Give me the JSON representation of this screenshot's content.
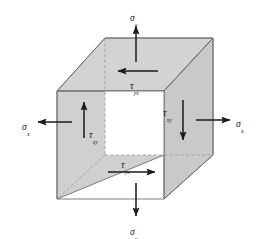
{
  "figure": {
    "type": "stress-element-3d-cube",
    "background_color": "#ffffff",
    "colors": {
      "top_face": "#d3d3d3",
      "left_face": "#d0d0d0",
      "right_face": "#c9c9c9",
      "front_face": "#ffffff",
      "edge_stroke": "#6e6e6e",
      "hidden_edge_stroke": "#9a9a9a",
      "arrow_color": "#1a1a1a",
      "label_color": "#1a1a1a"
    }
  },
  "labels": {
    "sigma_y_top": {
      "base": "σ",
      "sub": "y"
    },
    "sigma_y_bottom": {
      "base": "σ",
      "sub": "y"
    },
    "sigma_x_left": {
      "base": "σ",
      "sub": "x"
    },
    "sigma_x_right": {
      "base": "σ",
      "sub": "x"
    },
    "tau_yx_top": {
      "base": "τ",
      "sub": "yx"
    },
    "tau_yx_bottom": {
      "base": "τ",
      "sub": "yx"
    },
    "tau_xy_left": {
      "base": "τ",
      "sub": "xy"
    },
    "tau_xy_right": {
      "base": "τ",
      "sub": "xy"
    }
  },
  "arrows": [
    {
      "name": "sigma-y-top-arrow",
      "direction": "up",
      "stress": "σy"
    },
    {
      "name": "sigma-y-bottom-arrow",
      "direction": "down",
      "stress": "σy"
    },
    {
      "name": "sigma-x-left-arrow",
      "direction": "left",
      "stress": "σx"
    },
    {
      "name": "sigma-x-right-arrow",
      "direction": "right",
      "stress": "σx"
    },
    {
      "name": "tau-yx-top-arrow",
      "direction": "left",
      "stress": "τyx"
    },
    {
      "name": "tau-yx-bottom-arrow",
      "direction": "right",
      "stress": "τyx"
    },
    {
      "name": "tau-xy-left-arrow",
      "direction": "up",
      "stress": "τxy"
    },
    {
      "name": "tau-xy-right-arrow",
      "direction": "down",
      "stress": "τxy"
    }
  ]
}
